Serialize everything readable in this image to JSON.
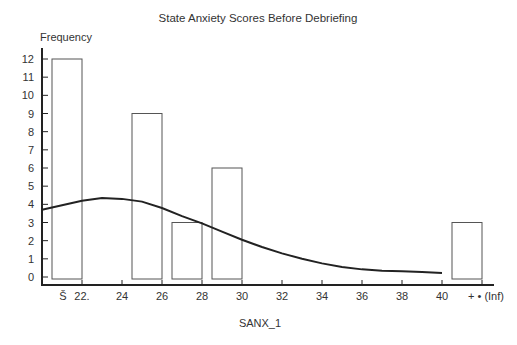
{
  "chart_data": {
    "type": "bar",
    "title": "State Anxiety Scores Before Debriefing",
    "ylabel": "Frequency",
    "xlabel": "SANX_1",
    "ylim": [
      0,
      12
    ],
    "yticks": [
      "0",
      "1",
      "2",
      "3",
      "4",
      "5",
      "6",
      "7",
      "8",
      "9",
      "10",
      "11",
      "12"
    ],
    "xtick_labels": [
      "Š",
      "22.",
      "24",
      "26",
      "28",
      "30",
      "32",
      "34",
      "36",
      "38",
      "40",
      "+ • (Inf)"
    ],
    "bars": [
      {
        "range": "≤22",
        "value": 12
      },
      {
        "range": "24-26",
        "value": 9
      },
      {
        "range": "26-28",
        "value": 3
      },
      {
        "range": "28-30",
        "value": 6
      },
      {
        "range": "40-Inf",
        "value": 3
      }
    ],
    "curve": {
      "type": "normal density overlay",
      "points": [
        [
          21,
          3.7
        ],
        [
          22,
          3.95
        ],
        [
          23,
          4.2
        ],
        [
          24,
          4.35
        ],
        [
          25,
          4.3
        ],
        [
          26,
          4.15
        ],
        [
          27,
          3.8
        ],
        [
          28,
          3.35
        ],
        [
          29,
          2.95
        ],
        [
          30,
          2.5
        ],
        [
          31,
          2.05
        ],
        [
          32,
          1.65
        ],
        [
          33,
          1.3
        ],
        [
          34,
          1.0
        ],
        [
          35,
          0.75
        ],
        [
          36,
          0.55
        ],
        [
          37,
          0.42
        ],
        [
          38,
          0.35
        ],
        [
          39,
          0.32
        ],
        [
          40,
          0.28
        ],
        [
          41,
          0.22
        ]
      ]
    },
    "grid": false,
    "legend": "none"
  }
}
